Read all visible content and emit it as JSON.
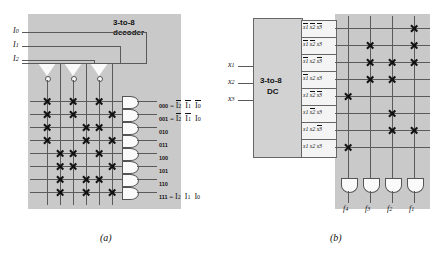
{
  "figure": {
    "panels": [
      {
        "id": "a",
        "caption": "(a)",
        "title": "3-to-8\ndecoder",
        "title_line1": "3-to-8",
        "title_line2": "decoder",
        "inputs": [
          "I0",
          "I1",
          "I2"
        ],
        "input_labels": [
          {
            "base": "I",
            "sub": "0"
          },
          {
            "base": "I",
            "sub": "1"
          },
          {
            "base": "I",
            "sub": "2"
          }
        ],
        "column_lines": [
          "I2bar",
          "I2",
          "I1bar",
          "I1",
          "I0bar",
          "I0"
        ],
        "inverter_count": 3,
        "and_gate_count": 8,
        "outputs": [
          {
            "code": "000",
            "expr_shown": true,
            "terms": [
              {
                "base": "I",
                "sub": "2",
                "bar": true
              },
              {
                "base": "I",
                "sub": "1",
                "bar": true
              },
              {
                "base": "I",
                "sub": "0",
                "bar": true
              }
            ]
          },
          {
            "code": "001",
            "expr_shown": true,
            "terms": [
              {
                "base": "I",
                "sub": "2",
                "bar": true
              },
              {
                "base": "I",
                "sub": "1",
                "bar": true
              },
              {
                "base": "I",
                "sub": "0",
                "bar": false
              }
            ]
          },
          {
            "code": "010",
            "expr_shown": false,
            "terms": []
          },
          {
            "code": "011",
            "expr_shown": false,
            "terms": []
          },
          {
            "code": "100",
            "expr_shown": false,
            "terms": []
          },
          {
            "code": "101",
            "expr_shown": false,
            "terms": []
          },
          {
            "code": "110",
            "expr_shown": false,
            "terms": []
          },
          {
            "code": "111",
            "expr_shown": true,
            "terms": [
              {
                "base": "I",
                "sub": "2",
                "bar": false
              },
              {
                "base": "I",
                "sub": "1",
                "bar": false
              },
              {
                "base": "I",
                "sub": "0",
                "bar": false
              }
            ]
          }
        ],
        "connection_matrix": [
          [
            1,
            0,
            1,
            0,
            1,
            0
          ],
          [
            1,
            0,
            1,
            0,
            0,
            1
          ],
          [
            1,
            0,
            0,
            1,
            1,
            0
          ],
          [
            1,
            0,
            0,
            1,
            0,
            1
          ],
          [
            0,
            1,
            1,
            0,
            1,
            0
          ],
          [
            0,
            1,
            1,
            0,
            0,
            1
          ],
          [
            0,
            1,
            0,
            1,
            1,
            0
          ],
          [
            0,
            1,
            0,
            1,
            0,
            1
          ]
        ]
      },
      {
        "id": "b",
        "caption": "(b)",
        "block_line1": "3-to-8",
        "block_line2": "DC",
        "inputs": [
          {
            "base": "x",
            "sub": "1"
          },
          {
            "base": "x",
            "sub": "2"
          },
          {
            "base": "x",
            "sub": "3"
          }
        ],
        "minterm_rows": [
          [
            {
              "base": "x",
              "sub": "1",
              "bar": true
            },
            {
              "base": "x",
              "sub": "2",
              "bar": true
            },
            {
              "base": "x",
              "sub": "3",
              "bar": true
            }
          ],
          [
            {
              "base": "x",
              "sub": "1",
              "bar": true
            },
            {
              "base": "x",
              "sub": "2",
              "bar": true
            },
            {
              "base": "x",
              "sub": "3",
              "bar": false
            }
          ],
          [
            {
              "base": "x",
              "sub": "1",
              "bar": true
            },
            {
              "base": "x",
              "sub": "2",
              "bar": false
            },
            {
              "base": "x",
              "sub": "3",
              "bar": true
            }
          ],
          [
            {
              "base": "x",
              "sub": "1",
              "bar": true
            },
            {
              "base": "x",
              "sub": "2",
              "bar": false
            },
            {
              "base": "x",
              "sub": "3",
              "bar": false
            }
          ],
          [
            {
              "base": "x",
              "sub": "1",
              "bar": false
            },
            {
              "base": "x",
              "sub": "2",
              "bar": true
            },
            {
              "base": "x",
              "sub": "3",
              "bar": true
            }
          ],
          [
            {
              "base": "x",
              "sub": "1",
              "bar": false
            },
            {
              "base": "x",
              "sub": "2",
              "bar": true
            },
            {
              "base": "x",
              "sub": "3",
              "bar": false
            }
          ],
          [
            {
              "base": "x",
              "sub": "1",
              "bar": false
            },
            {
              "base": "x",
              "sub": "2",
              "bar": false
            },
            {
              "base": "x",
              "sub": "3",
              "bar": true
            }
          ],
          [
            {
              "base": "x",
              "sub": "1",
              "bar": false
            },
            {
              "base": "x",
              "sub": "2",
              "bar": false
            },
            {
              "base": "x",
              "sub": "3",
              "bar": false
            }
          ]
        ],
        "output_columns": [
          {
            "base": "f",
            "sub": "4"
          },
          {
            "base": "f",
            "sub": "3"
          },
          {
            "base": "f",
            "sub": "2"
          },
          {
            "base": "f",
            "sub": "1"
          }
        ],
        "or_gate_count": 4,
        "connection_matrix": [
          [
            0,
            0,
            0,
            1
          ],
          [
            0,
            1,
            0,
            1
          ],
          [
            0,
            1,
            1,
            1
          ],
          [
            0,
            1,
            1,
            0
          ],
          [
            1,
            0,
            0,
            0
          ],
          [
            0,
            0,
            1,
            0
          ],
          [
            0,
            0,
            1,
            1
          ],
          [
            1,
            0,
            0,
            0
          ]
        ]
      }
    ]
  },
  "colors": {
    "panel_fill": "#c9c9c9",
    "block_fill": "#d2d2d2",
    "wire": "#5a5a5a",
    "mark": "#111111",
    "page": "#ffffff"
  }
}
